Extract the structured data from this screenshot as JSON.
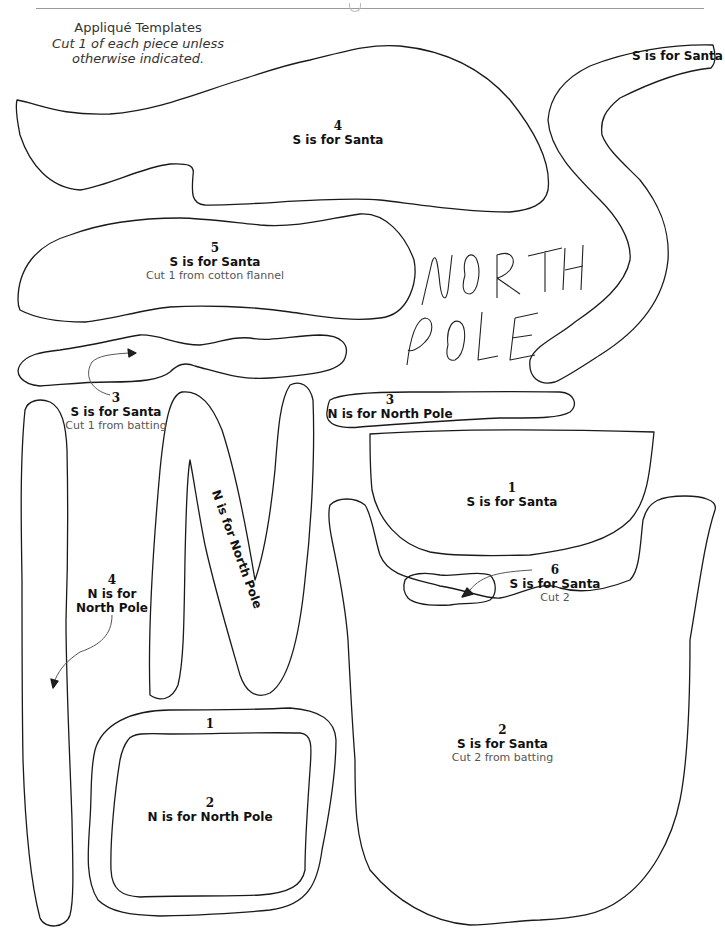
{
  "header": {
    "title": "Appliqué Templates",
    "subtitle_line1": "Cut 1 of each piece unless",
    "subtitle_line2": "otherwise indicated."
  },
  "handwriting": {
    "line1": "NORTH",
    "line2": "POLE"
  },
  "pieces": [
    {
      "id": "s4",
      "number": "4",
      "name": "S is for Santa",
      "note": ""
    },
    {
      "id": "s-curve",
      "number": "",
      "name": "S is for Santa",
      "note": ""
    },
    {
      "id": "s5",
      "number": "5",
      "name": "S is for Santa",
      "note": "Cut 1 from cotton flannel"
    },
    {
      "id": "s3",
      "number": "3",
      "name": "S is for Santa",
      "note": "Cut 1 from batting"
    },
    {
      "id": "n3",
      "number": "3",
      "name": "N is for North Pole",
      "note": ""
    },
    {
      "id": "s1",
      "number": "1",
      "name": "S is for Santa",
      "note": ""
    },
    {
      "id": "n-letter",
      "number": "",
      "name": "N is for North Pole",
      "note": ""
    },
    {
      "id": "n4",
      "number": "4",
      "name_line1": "N is for",
      "name_line2": "North Pole",
      "note": ""
    },
    {
      "id": "s6",
      "number": "6",
      "name": "S is for Santa",
      "note": "Cut 2"
    },
    {
      "id": "n1",
      "number": "1",
      "name": "",
      "note": ""
    },
    {
      "id": "n2",
      "number": "2",
      "name": "N is for North Pole",
      "note": ""
    },
    {
      "id": "s2",
      "number": "2",
      "name": "S is for Santa",
      "note": "Cut 2 from batting"
    }
  ],
  "colors": {
    "outline": "#1a1a1a",
    "note_text": "#555555",
    "rule": "#9a9a9a"
  }
}
